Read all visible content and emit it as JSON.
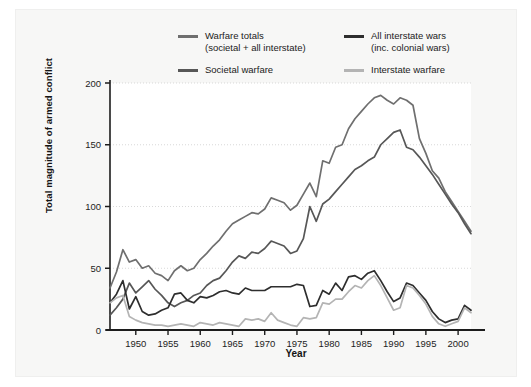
{
  "figure": {
    "background": "#f7f7f6",
    "plot_background": "#ffffff"
  },
  "legend": {
    "position": "top",
    "entries": [
      {
        "label_line1": "Warfare totals",
        "label_line2": "(societal  +  all interstate)",
        "color": "#6f6f6f",
        "name": "warfare-totals"
      },
      {
        "label_line1": "All interstate wars",
        "label_line2": "(inc. colonial wars)",
        "color": "#2e2e2e",
        "name": "all-interstate-wars"
      },
      {
        "label_line1": "Societal warfare",
        "label_line2": "",
        "color": "#575757",
        "name": "societal-warfare"
      },
      {
        "label_line1": "Interstate warfare",
        "label_line2": "",
        "color": "#b4b4b4",
        "name": "interstate-warfare"
      }
    ]
  },
  "chart_data": {
    "type": "line",
    "title": "",
    "xlabel": "Year",
    "ylabel": "Total magnitude of armed conflict",
    "xlim": [
      1946,
      2002
    ],
    "ylim": [
      0,
      200
    ],
    "xticks": [
      1950,
      1955,
      1960,
      1965,
      1970,
      1975,
      1980,
      1985,
      1990,
      1995,
      2000
    ],
    "yticks": [
      0,
      50,
      100,
      150,
      200
    ],
    "grid": "horizontal-dotted",
    "x": [
      1946,
      1947,
      1948,
      1949,
      1950,
      1951,
      1952,
      1953,
      1954,
      1955,
      1956,
      1957,
      1958,
      1959,
      1960,
      1961,
      1962,
      1963,
      1964,
      1965,
      1966,
      1967,
      1968,
      1969,
      1970,
      1971,
      1972,
      1973,
      1974,
      1975,
      1976,
      1977,
      1978,
      1979,
      1980,
      1981,
      1982,
      1983,
      1984,
      1985,
      1986,
      1987,
      1988,
      1989,
      1990,
      1991,
      1992,
      1993,
      1994,
      1995,
      1996,
      1997,
      1998,
      1999,
      2000,
      2001,
      2002
    ],
    "series": [
      {
        "name": "Warfare totals (societal + all interstate)",
        "color": "#6f6f6f",
        "values": [
          34,
          47,
          65,
          55,
          57,
          50,
          52,
          46,
          44,
          40,
          48,
          52,
          48,
          50,
          57,
          62,
          68,
          73,
          80,
          86,
          89,
          92,
          95,
          94,
          98,
          107,
          105,
          103,
          97,
          101,
          110,
          119,
          108,
          137,
          135,
          148,
          150,
          163,
          171,
          177,
          183,
          188,
          190,
          186,
          183,
          188,
          186,
          182,
          155,
          143,
          129,
          123,
          112,
          104,
          96,
          88,
          80
        ]
      },
      {
        "name": "Societal warfare",
        "color": "#575757",
        "values": [
          12,
          18,
          25,
          38,
          30,
          35,
          40,
          33,
          28,
          22,
          19,
          22,
          24,
          28,
          30,
          36,
          40,
          42,
          48,
          55,
          60,
          58,
          63,
          62,
          66,
          72,
          70,
          68,
          62,
          64,
          74,
          100,
          88,
          102,
          106,
          112,
          118,
          124,
          130,
          133,
          137,
          140,
          150,
          155,
          160,
          162,
          148,
          146,
          140,
          133,
          126,
          118,
          110,
          102,
          95,
          86,
          78
        ]
      },
      {
        "name": "All interstate wars (inc. colonial wars)",
        "color": "#2e2e2e",
        "values": [
          22,
          29,
          40,
          17,
          27,
          15,
          12,
          13,
          16,
          18,
          29,
          30,
          24,
          22,
          27,
          26,
          28,
          31,
          32,
          30,
          29,
          34,
          32,
          32,
          32,
          35,
          35,
          35,
          35,
          37,
          36,
          19,
          20,
          32,
          29,
          38,
          32,
          43,
          44,
          41,
          46,
          48,
          40,
          31,
          23,
          26,
          38,
          36,
          30,
          24,
          15,
          9,
          6,
          8,
          9,
          20,
          16
        ]
      },
      {
        "name": "Interstate warfare",
        "color": "#b4b4b4",
        "values": [
          22,
          26,
          28,
          11,
          8,
          6,
          5,
          4,
          4,
          3,
          4,
          5,
          4,
          3,
          6,
          5,
          4,
          6,
          5,
          4,
          3,
          9,
          8,
          9,
          7,
          14,
          8,
          6,
          4,
          3,
          10,
          9,
          10,
          22,
          21,
          25,
          25,
          31,
          36,
          34,
          40,
          44,
          36,
          26,
          16,
          18,
          36,
          34,
          28,
          21,
          11,
          5,
          3,
          5,
          7,
          18,
          14
        ]
      }
    ]
  }
}
